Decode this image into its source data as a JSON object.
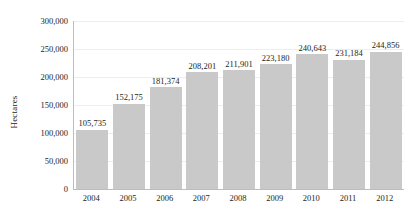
{
  "chart_data": {
    "type": "bar",
    "title": "",
    "subtitle": "",
    "xlabel": "",
    "ylabel": "Hectares",
    "categories": [
      "2004",
      "2005",
      "2006",
      "2007",
      "2008",
      "2009",
      "2010",
      "2011",
      "2012"
    ],
    "values": [
      105735,
      152175,
      181374,
      208201,
      211901,
      223180,
      240643,
      231184,
      244856
    ],
    "value_labels": [
      "105,735",
      "152,175",
      "181,374",
      "208,201",
      "211,901",
      "223,180",
      "240,643",
      "231,184",
      "244,856"
    ],
    "ylim": [
      0,
      300000
    ],
    "y_ticks": [
      0,
      50000,
      100000,
      150000,
      200000,
      250000,
      300000
    ],
    "y_tick_labels": [
      "0",
      "50,000",
      "100,000",
      "150,000",
      "200,000",
      "250,000",
      "300,000"
    ],
    "grid": true,
    "grid_axis": "y",
    "legend": false,
    "legend_position": "none",
    "series": [
      {
        "name": "Hectares",
        "color": "#c9c9c9",
        "values": [
          105735,
          152175,
          181374,
          208201,
          211901,
          223180,
          240643,
          231184,
          244856
        ]
      }
    ],
    "colors": {
      "bar": "#c9c9c9",
      "axis": "#bdbdbd",
      "grid": "#ededed",
      "text": "#231f20",
      "background": "#ffffff"
    }
  }
}
